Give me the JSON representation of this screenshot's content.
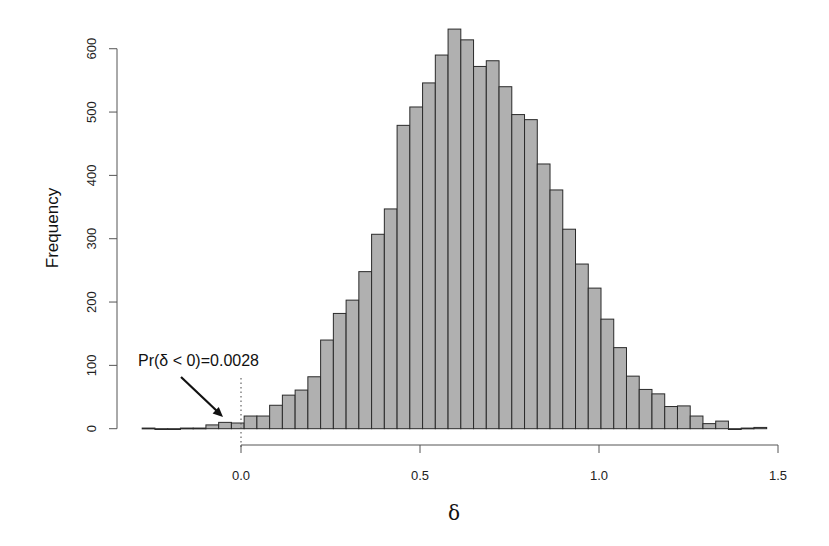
{
  "chart_data": {
    "type": "bar",
    "subtype": "histogram",
    "title": "",
    "xlabel": "δ",
    "ylabel": "Frequency",
    "xlim": [
      -0.3,
      1.5
    ],
    "ylim": [
      0,
      600
    ],
    "x_ticks": [
      0.0,
      0.5,
      1.0,
      1.5
    ],
    "x_tick_labels": [
      "0.0",
      "0.5",
      "1.0",
      "1.5"
    ],
    "y_ticks": [
      0,
      100,
      200,
      300,
      400,
      500,
      600
    ],
    "y_tick_labels": [
      "0",
      "100",
      "200",
      "300",
      "400",
      "500",
      "600"
    ],
    "grid": false,
    "legend": null,
    "bin_start": -0.276,
    "bin_width": 0.0356,
    "values": [
      1,
      0,
      0,
      1,
      1,
      6,
      10,
      9,
      20,
      20,
      37,
      53,
      61,
      82,
      140,
      182,
      203,
      248,
      307,
      347,
      479,
      508,
      546,
      590,
      631,
      614,
      572,
      581,
      540,
      496,
      488,
      418,
      377,
      315,
      260,
      222,
      173,
      128,
      83,
      62,
      55,
      35,
      36,
      20,
      8,
      12,
      0,
      1,
      2
    ],
    "bar_color": "#b0b0b0",
    "bar_edge_color": "#2a2a2a",
    "reference_line": {
      "x": 0.0,
      "style": "dotted"
    },
    "annotations": [
      {
        "text": "Pr(δ < 0)=0.0028",
        "arrow_to_x": -0.05,
        "arrow_to_y": 20
      }
    ]
  }
}
